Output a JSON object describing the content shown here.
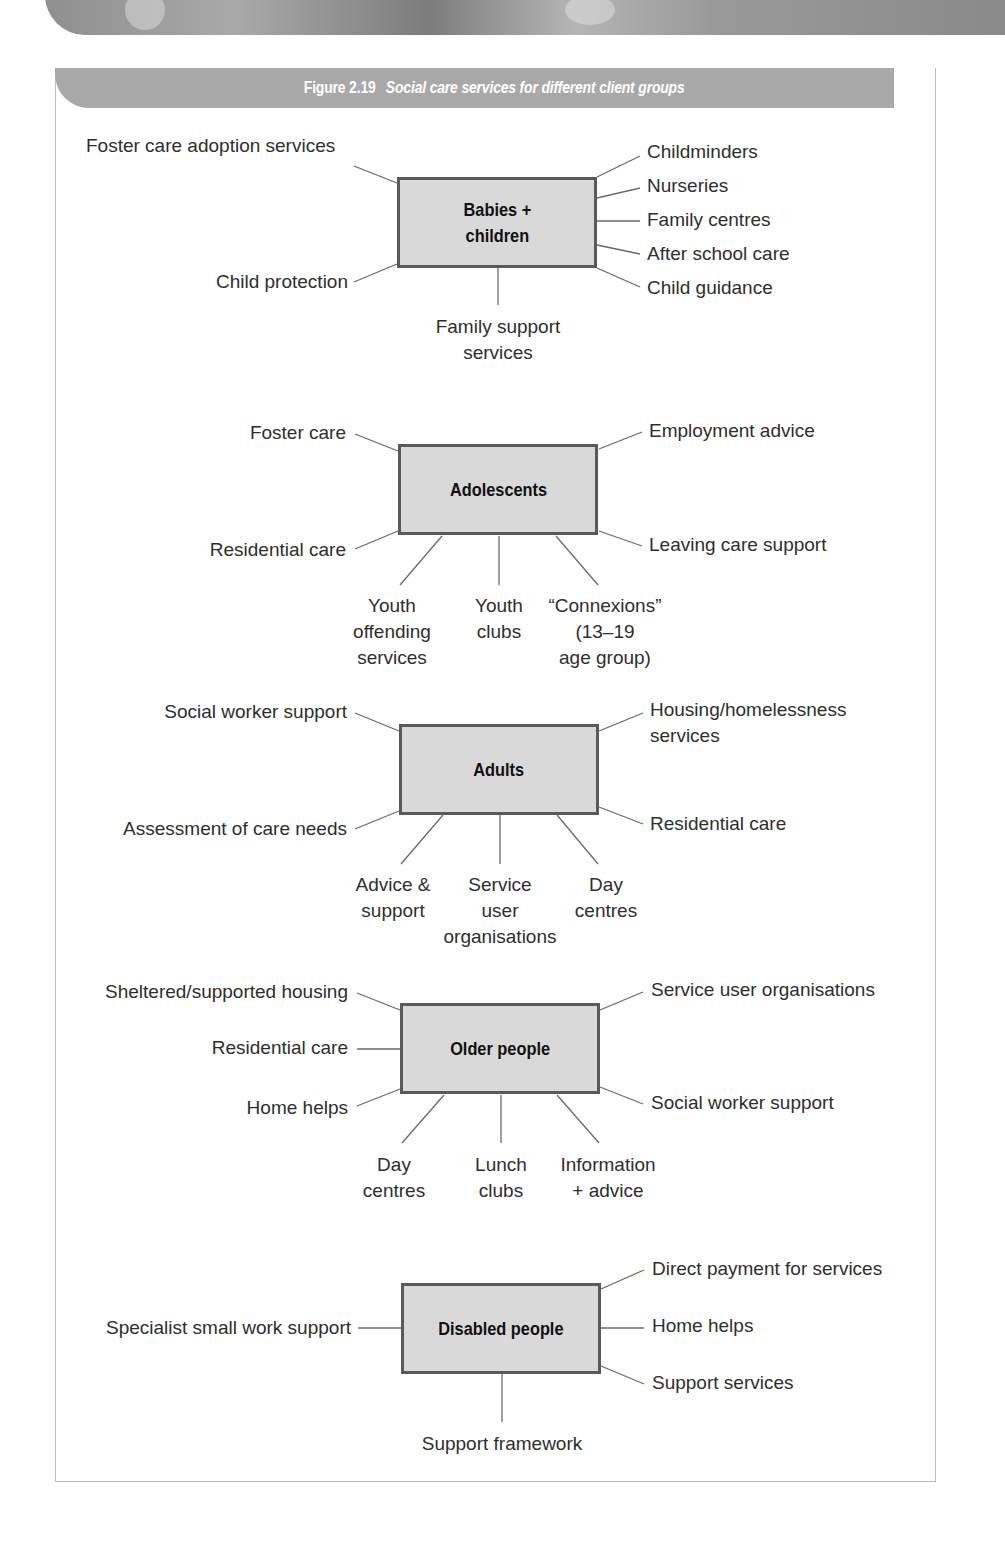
{
  "figure": {
    "number": "Figure 2.19",
    "title": "Social care services for different client groups"
  },
  "colors": {
    "header_band": "#a9a9a9",
    "box_fill": "#d9d9d9",
    "box_border": "#5a5a5a",
    "connector": "#6a6a6a",
    "text": "#2e2e2e"
  },
  "groups": [
    {
      "name": "Babies + children",
      "name_lines": [
        "Babies +",
        "children"
      ],
      "services": {
        "left": [
          "Foster care adoption services",
          "Child protection"
        ],
        "right": [
          "Childminders",
          "Nurseries",
          "Family centres",
          "After school care",
          "Child guidance"
        ],
        "bottom": [
          "Family support services"
        ]
      }
    },
    {
      "name": "Adolescents",
      "services": {
        "left": [
          "Foster care",
          "Residential care"
        ],
        "right": [
          "Employment advice",
          "Leaving care support"
        ],
        "bottom": [
          "Youth offending services",
          "Youth clubs",
          "“Connexions” (13–19 age group)"
        ]
      }
    },
    {
      "name": "Adults",
      "services": {
        "left": [
          "Social worker support",
          "Assessment of care needs"
        ],
        "right": [
          "Housing/homelessness services",
          "Residential care"
        ],
        "bottom": [
          "Advice & support",
          "Service user organisations",
          "Day centres"
        ]
      }
    },
    {
      "name": "Older people",
      "services": {
        "left": [
          "Sheltered/supported housing",
          "Residential care",
          "Home helps"
        ],
        "right": [
          "Service user organisations",
          "Social worker support"
        ],
        "bottom": [
          "Day centres",
          "Lunch clubs",
          "Information + advice"
        ]
      }
    },
    {
      "name": "Disabled people",
      "services": {
        "left": [
          "Specialist small work support"
        ],
        "right": [
          "Direct payment for services",
          "Home helps",
          "Support services"
        ],
        "bottom": [
          "Support framework"
        ]
      }
    }
  ],
  "labels": {
    "g0_bottom0_l1": "Family support",
    "g0_bottom0_l2": "services",
    "g1_bottom0_l1": "Youth",
    "g1_bottom0_l2": "offending",
    "g1_bottom0_l3": "services",
    "g1_bottom1_l1": "Youth",
    "g1_bottom1_l2": "clubs",
    "g1_bottom2_l1": "“Connexions”",
    "g1_bottom2_l2": "(13–19",
    "g1_bottom2_l3": "age group)",
    "g2_right0_l1": "Housing/homelessness",
    "g2_right0_l2": "services",
    "g2_bottom0_l1": "Advice &",
    "g2_bottom0_l2": "support",
    "g2_bottom1_l1": "Service",
    "g2_bottom1_l2": "user",
    "g2_bottom1_l3": "organisations",
    "g2_bottom2_l1": "Day",
    "g2_bottom2_l2": "centres",
    "g3_bottom0_l1": "Day",
    "g3_bottom0_l2": "centres",
    "g3_bottom1_l1": "Lunch",
    "g3_bottom1_l2": "clubs",
    "g3_bottom2_l1": "Information",
    "g3_bottom2_l2": "+ advice"
  }
}
